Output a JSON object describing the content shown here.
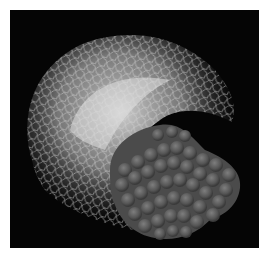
{
  "figure": {
    "alt": "Molecular rendering: a light wireframe arc of many overlaid conformations wrapping over a dark-gray space-filling sphere cluster on a black background",
    "background_color": "#050505",
    "page_color": "#ffffff",
    "wireframe_color": "#cfcfcf",
    "sphere_color": "#5a5a5a",
    "sphere_highlight": "#7a7a7a"
  }
}
